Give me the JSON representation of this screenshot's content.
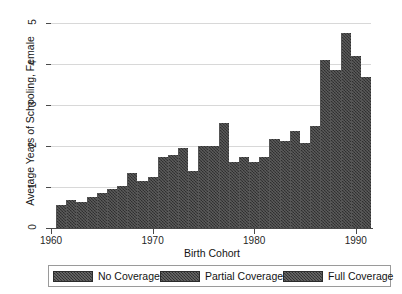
{
  "chart_data": {
    "type": "bar",
    "title": "",
    "xlabel": "Birth Cohort",
    "ylabel": "Average Years of Schooling, Female",
    "xlim": [
      1960,
      1991.5
    ],
    "ylim": [
      0,
      5
    ],
    "grid": true,
    "x_ticks": [
      "1960",
      "1970",
      "1980",
      "1990"
    ],
    "x_tick_values": [
      1960,
      1970,
      1980,
      1990
    ],
    "y_ticks": [
      "0",
      "1",
      "2",
      "3",
      "4",
      "5"
    ],
    "y_tick_values": [
      0,
      1,
      2,
      3,
      4,
      5
    ],
    "categories": [
      1961,
      1962,
      1963,
      1964,
      1965,
      1966,
      1967,
      1968,
      1969,
      1970,
      1971,
      1972,
      1973,
      1974,
      1975,
      1976,
      1977,
      1978,
      1979,
      1980,
      1981,
      1982,
      1983,
      1984,
      1985,
      1986,
      1987,
      1988,
      1989,
      1990,
      1991
    ],
    "values": [
      0.57,
      0.69,
      0.63,
      0.76,
      0.85,
      0.95,
      1.03,
      1.34,
      1.15,
      1.25,
      1.72,
      1.79,
      1.95,
      1.38,
      1.99,
      2.01,
      2.56,
      1.62,
      1.72,
      1.6,
      1.73,
      2.18,
      2.13,
      2.36,
      2.07,
      2.5,
      4.09,
      3.85,
      4.75,
      4.19,
      3.68
    ],
    "legend_position": "below-axes",
    "legend": [
      {
        "label": "No Coverage",
        "swatch": "dark-hatch"
      },
      {
        "label": "Partial Coverage",
        "swatch": "dark-hatch"
      },
      {
        "label": "Full Coverage",
        "swatch": "dark-hatch"
      }
    ],
    "bar_color": "#3c3c3c",
    "gridline_color": "#d8d8d8",
    "axis_color": "#4a4a4a"
  }
}
